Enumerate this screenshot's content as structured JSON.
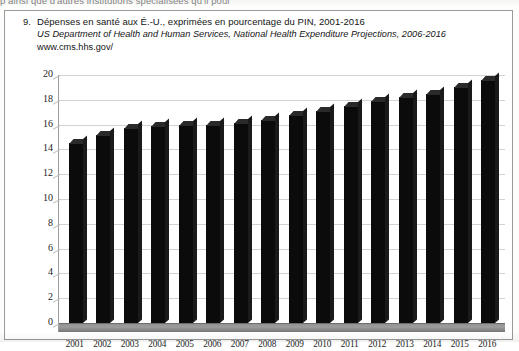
{
  "page": {
    "clipped_top_line": "p                                       ainsi que d'autres institutions spécialisées qu'il pour"
  },
  "caption": {
    "number": "9.",
    "title": "Dépenses en santé aux É.-U., exprimées en pourcentage du PIN, 2001-2016",
    "source_italic": "US Department of Health and Human Services, National Health Expenditure Projections, 2006-2016",
    "url": "www.cms.hhs.gov/"
  },
  "chart_data": {
    "type": "bar",
    "title": "Dépenses en santé aux É.-U., exprimées en pourcentage du PIN, 2001-2016",
    "xlabel": "",
    "ylabel": "",
    "ylim": [
      0,
      20
    ],
    "ytick_step": 2,
    "yticks": [
      "20",
      "18",
      "16",
      "14",
      "12",
      "10",
      "8",
      "6",
      "4",
      "2",
      "0"
    ],
    "grid": true,
    "legend": "none",
    "bar_color": "#0b0b0b",
    "grid_color": "#d2d2d2",
    "floor_color": "#9d9d9d",
    "categories": [
      "2001",
      "2002",
      "2003",
      "2004",
      "2005",
      "2006",
      "2007",
      "2008",
      "2009",
      "2010",
      "2011",
      "2012",
      "2013",
      "2014",
      "2015",
      "2016"
    ],
    "values": [
      14.5,
      15.2,
      15.7,
      15.9,
      16.0,
      16.0,
      16.1,
      16.4,
      16.8,
      17.1,
      17.5,
      17.9,
      18.2,
      18.5,
      19.0,
      19.6
    ]
  }
}
